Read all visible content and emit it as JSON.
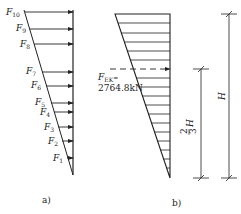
{
  "diagram": {
    "panel_a": {
      "caption": "a)",
      "forces": [
        {
          "name": "F",
          "sub": "10",
          "y": 12
        },
        {
          "name": "F",
          "sub": "9",
          "y": 29
        },
        {
          "name": "F",
          "sub": "8",
          "y": 44
        },
        {
          "name": "F",
          "sub": "7",
          "y": 72
        },
        {
          "name": "F",
          "sub": "6",
          "y": 86
        },
        {
          "name": "F",
          "sub": "5",
          "y": 103
        },
        {
          "name": "F",
          "sub": "4",
          "y": 112
        },
        {
          "name": "F",
          "sub": "3",
          "y": 127
        },
        {
          "name": "F",
          "sub": "2",
          "y": 141
        },
        {
          "name": "F",
          "sub": "1",
          "y": 158
        }
      ]
    },
    "panel_b": {
      "caption": "b)",
      "resultant": {
        "name": "F",
        "sub": "EK",
        "eq": "=",
        "value": "2764.8kN"
      },
      "dimensions": {
        "short": {
          "label_num": "2",
          "label_den": "3",
          "label_var": "H"
        },
        "full": {
          "label": "H"
        }
      }
    }
  }
}
